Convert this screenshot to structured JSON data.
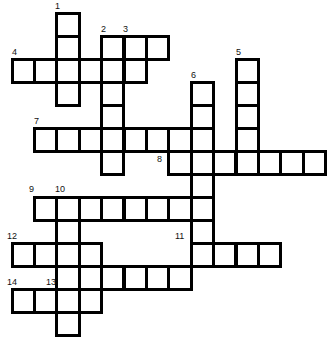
{
  "puzzle": {
    "type": "crossword",
    "grid": {
      "origin_x": 12,
      "origin_y": 13,
      "cell_w": 22.4,
      "cell_h": 23
    },
    "words": [
      {
        "number": 1,
        "direction": "down",
        "col": 2,
        "row": 0,
        "length": 4
      },
      {
        "number": 2,
        "direction": "across",
        "col": 4,
        "row": 1,
        "length": 3
      },
      {
        "number": 2,
        "direction": "down",
        "col": 4,
        "row": 1,
        "length": 6
      },
      {
        "number": 3,
        "direction": "down",
        "col": 5,
        "row": 1,
        "length": 2
      },
      {
        "number": 4,
        "direction": "across",
        "col": 0,
        "row": 2,
        "length": 6
      },
      {
        "number": 5,
        "direction": "down",
        "col": 10,
        "row": 2,
        "length": 5
      },
      {
        "number": 6,
        "direction": "down",
        "col": 8,
        "row": 3,
        "length": 8
      },
      {
        "number": 7,
        "direction": "across",
        "col": 1,
        "row": 5,
        "length": 8
      },
      {
        "number": 8,
        "direction": "across",
        "col": 7,
        "row": 6,
        "length": 7
      },
      {
        "number": 9,
        "direction": "across",
        "col": 1,
        "row": 8,
        "length": 8
      },
      {
        "number": 10,
        "direction": "down",
        "col": 2,
        "row": 8,
        "length": 6
      },
      {
        "number": 11,
        "direction": "across",
        "col": 8,
        "row": 10,
        "length": 4
      },
      {
        "number": 12,
        "direction": "across",
        "col": 0,
        "row": 10,
        "length": 4
      },
      {
        "number": 13,
        "direction": "across",
        "col": 2,
        "row": 11,
        "length": 6
      },
      {
        "number": 14,
        "direction": "across",
        "col": 0,
        "row": 12,
        "length": 4
      }
    ],
    "labels": [
      {
        "text": "1",
        "x": 55,
        "y": 2
      },
      {
        "text": "2",
        "x": 101,
        "y": 25
      },
      {
        "text": "3",
        "x": 123,
        "y": 25
      },
      {
        "text": "4",
        "x": 12,
        "y": 48
      },
      {
        "text": "5",
        "x": 236,
        "y": 48
      },
      {
        "text": "6",
        "x": 191,
        "y": 71
      },
      {
        "text": "7",
        "x": 34,
        "y": 117
      },
      {
        "text": "8",
        "x": 157,
        "y": 155
      },
      {
        "text": "9",
        "x": 29,
        "y": 185
      },
      {
        "text": "10",
        "x": 55,
        "y": 185
      },
      {
        "text": "11",
        "x": 175,
        "y": 232
      },
      {
        "text": "12",
        "x": 7,
        "y": 232
      },
      {
        "text": "13",
        "x": 46,
        "y": 278
      },
      {
        "text": "14",
        "x": 7,
        "y": 278
      }
    ]
  }
}
